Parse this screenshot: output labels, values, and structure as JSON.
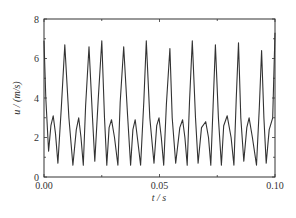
{
  "chart_data": {
    "type": "line",
    "title": "",
    "xlabel": "t / s",
    "ylabel": "u / (m/s)",
    "xlim": [
      0,
      0.1
    ],
    "ylim": [
      0,
      8
    ],
    "grid": false,
    "legend": null,
    "x_ticks": [
      "0.00",
      "0.05",
      "0.10"
    ],
    "y_ticks": [
      "0",
      "2",
      "4",
      "6",
      "8"
    ],
    "series": [
      {
        "name": "u",
        "color": "#333333",
        "x": [
          0.0,
          0.0008,
          0.002,
          0.003,
          0.004,
          0.005,
          0.006,
          0.0075,
          0.009,
          0.0108,
          0.0125,
          0.014,
          0.015,
          0.016,
          0.017,
          0.018,
          0.0195,
          0.021,
          0.022,
          0.0235,
          0.025,
          0.0262,
          0.0272,
          0.0282,
          0.0292,
          0.0305,
          0.032,
          0.033,
          0.0345,
          0.0362,
          0.0375,
          0.0385,
          0.0395,
          0.0405,
          0.0418,
          0.0432,
          0.0443,
          0.0458,
          0.0476,
          0.0488,
          0.0498,
          0.0508,
          0.0518,
          0.053,
          0.0545,
          0.0555,
          0.057,
          0.0588,
          0.06,
          0.061,
          0.062,
          0.063,
          0.0642,
          0.0656,
          0.0667,
          0.0682,
          0.07,
          0.0712,
          0.0722,
          0.0732,
          0.0742,
          0.0755,
          0.0768,
          0.0778,
          0.0793,
          0.081,
          0.0822,
          0.0832,
          0.0842,
          0.0852,
          0.0865,
          0.0878,
          0.0888,
          0.0902,
          0.092,
          0.0932,
          0.0942,
          0.0952,
          0.0962,
          0.0975,
          0.099,
          0.1
        ],
        "y": [
          6.9,
          4.0,
          1.3,
          2.6,
          3.1,
          2.2,
          0.7,
          3.5,
          6.7,
          3.0,
          0.6,
          2.4,
          3.0,
          2.0,
          0.6,
          3.6,
          6.6,
          3.0,
          0.8,
          4.0,
          6.9,
          3.0,
          0.6,
          2.5,
          2.9,
          2.0,
          0.6,
          3.8,
          6.6,
          3.1,
          0.6,
          2.4,
          2.9,
          1.9,
          0.6,
          3.8,
          6.9,
          3.0,
          0.7,
          2.6,
          3.0,
          2.0,
          0.6,
          3.7,
          6.5,
          3.0,
          0.7,
          2.5,
          2.9,
          2.0,
          0.6,
          3.8,
          6.9,
          3.0,
          0.7,
          2.5,
          2.8,
          2.0,
          0.6,
          3.6,
          6.7,
          3.0,
          0.6,
          2.6,
          3.1,
          2.0,
          0.6,
          3.9,
          6.8,
          3.0,
          0.8,
          2.5,
          3.0,
          2.0,
          0.6,
          3.5,
          6.4,
          3.0,
          0.7,
          2.4,
          3.0,
          7.3
        ]
      }
    ]
  }
}
